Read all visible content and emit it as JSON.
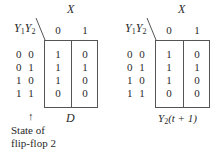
{
  "maps": [
    {
      "id": "left",
      "column_variable": "X",
      "row_variables": [
        "Y",
        "Y"
      ],
      "row_variable_subscripts": [
        "1",
        "2"
      ],
      "column_headers": [
        "0",
        "1"
      ],
      "row_labels": [
        "0 0",
        "0 1",
        "1 0",
        "1 1"
      ],
      "cells": [
        [
          "1",
          "0"
        ],
        [
          "1",
          "1"
        ],
        [
          "1",
          "0"
        ],
        [
          "0",
          "0"
        ]
      ],
      "caption": "D",
      "annotation": {
        "arrow": "↑",
        "line1": "State of",
        "line2": "flip-flop 2"
      }
    },
    {
      "id": "right",
      "column_variable": "X",
      "row_variables": [
        "Y",
        "Y"
      ],
      "row_variable_subscripts": [
        "1",
        "2"
      ],
      "column_headers": [
        "0",
        "1"
      ],
      "row_labels": [
        "0 0",
        "0 1",
        "1 0",
        "1 1"
      ],
      "cells": [
        [
          "1",
          "0"
        ],
        [
          "1",
          "1"
        ],
        [
          "1",
          "0"
        ],
        [
          "0",
          "0"
        ]
      ],
      "caption_var": "Y",
      "caption_sub": "2",
      "caption_rest": "(t + 1)"
    }
  ]
}
